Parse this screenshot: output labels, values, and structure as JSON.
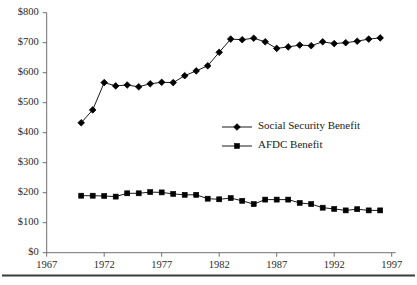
{
  "chart_data": {
    "type": "line",
    "title": "",
    "subtitle": "",
    "xlabel": "",
    "ylabel": "",
    "xlim": [
      1967,
      1997
    ],
    "ylim": [
      0,
      800
    ],
    "x_ticks": [
      1967,
      1972,
      1977,
      1982,
      1987,
      1992,
      1997
    ],
    "x_tick_labels": [
      "1967",
      "1972",
      "1977",
      "1982",
      "1987",
      "1992",
      "1997"
    ],
    "y_ticks": [
      0,
      100,
      200,
      300,
      400,
      500,
      600,
      700,
      800
    ],
    "y_tick_labels": [
      "$0",
      "$100",
      "$200",
      "$300",
      "$400",
      "$500",
      "$600",
      "$700",
      "$800"
    ],
    "grid": false,
    "legend_position": "inside-right-middle",
    "x": [
      1970,
      1971,
      1972,
      1973,
      1974,
      1975,
      1976,
      1977,
      1978,
      1979,
      1980,
      1981,
      1982,
      1983,
      1984,
      1985,
      1986,
      1987,
      1988,
      1989,
      1990,
      1991,
      1992,
      1993,
      1994,
      1995,
      1996
    ],
    "series": [
      {
        "name": "Social Security Benefit",
        "marker": "diamond",
        "color": "#000000",
        "values": [
          433,
          476,
          567,
          556,
          559,
          553,
          563,
          568,
          567,
          590,
          606,
          623,
          668,
          712,
          710,
          715,
          703,
          681,
          686,
          692,
          690,
          703,
          697,
          700,
          705,
          712,
          716
        ]
      },
      {
        "name": "AFDC Benefit",
        "marker": "square",
        "color": "#000000",
        "values": [
          190,
          190,
          189,
          187,
          198,
          198,
          202,
          201,
          196,
          193,
          193,
          180,
          178,
          182,
          173,
          162,
          177,
          177,
          177,
          166,
          162,
          150,
          146,
          141,
          145,
          141,
          141
        ]
      }
    ]
  },
  "legend": {
    "items": [
      {
        "label": "Social Security Benefit",
        "marker": "diamond"
      },
      {
        "label": "AFDC Benefit",
        "marker": "square"
      }
    ]
  },
  "figure": {
    "bottom_rule": true
  }
}
